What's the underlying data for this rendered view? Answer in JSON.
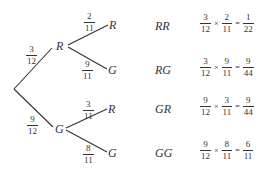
{
  "tree": {
    "first_level": [
      {
        "label": "R",
        "probability": {
          "num": "3",
          "den": "12"
        }
      },
      {
        "label": "G",
        "probability": {
          "num": "9",
          "den": "12"
        }
      }
    ],
    "second_level": {
      "R": [
        {
          "label": "R",
          "probability": {
            "num": "2",
            "den": "11"
          }
        },
        {
          "label": "G",
          "probability": {
            "num": "9",
            "den": "11"
          }
        }
      ],
      "G": [
        {
          "label": "R",
          "probability": {
            "num": "3",
            "den": "11"
          }
        },
        {
          "label": "G",
          "probability": {
            "num": "8",
            "den": "11"
          }
        }
      ]
    }
  },
  "outcomes": [
    {
      "name": "RR",
      "a": {
        "num": "3",
        "den": "12"
      },
      "op": "×",
      "b": {
        "num": "2",
        "den": "11"
      },
      "eq": "=",
      "result": {
        "num": "1",
        "den": "22"
      }
    },
    {
      "name": "RG",
      "a": {
        "num": "3",
        "den": "12"
      },
      "op": "×",
      "b": {
        "num": "9",
        "den": "11"
      },
      "eq": "=",
      "result": {
        "num": "9",
        "den": "44"
      }
    },
    {
      "name": "GR",
      "a": {
        "num": "9",
        "den": "12"
      },
      "op": "×",
      "b": {
        "num": "3",
        "den": "11"
      },
      "eq": "=",
      "result": {
        "num": "9",
        "den": "44"
      }
    },
    {
      "name": "GG",
      "a": {
        "num": "9",
        "den": "12"
      },
      "op": "×",
      "b": {
        "num": "8",
        "den": "11"
      },
      "eq": "=",
      "result": {
        "num": "6",
        "den": "11"
      }
    }
  ]
}
